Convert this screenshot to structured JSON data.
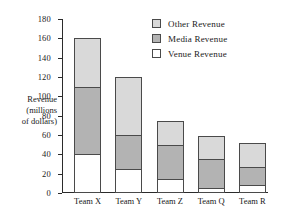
{
  "chart_data": {
    "type": "bar",
    "stacked": true,
    "title": "",
    "xlabel": "",
    "ylabel": "Revenue (millions of dollars)",
    "ylabel_lines": [
      "Revenue",
      "(millions",
      "of dollars)"
    ],
    "categories": [
      "Team X",
      "Team Y",
      "Team Z",
      "Team Q",
      "Team R"
    ],
    "series": [
      {
        "name": "Venue Revenue",
        "color": "#ffffff",
        "values": [
          40,
          25,
          15,
          5,
          8
        ]
      },
      {
        "name": "Media Revenue",
        "color": "#b3b3b3",
        "values": [
          70,
          35,
          35,
          30,
          19
        ]
      },
      {
        "name": "Other Revenue",
        "color": "#d9d9d9",
        "values": [
          50,
          60,
          25,
          24,
          25
        ]
      }
    ],
    "totals": [
      160,
      120,
      75,
      59,
      52
    ],
    "ylim": [
      0,
      180
    ],
    "ytick_step": 20,
    "yticks": [
      0,
      20,
      40,
      60,
      80,
      100,
      120,
      140,
      160,
      180
    ],
    "ytick_labels": [
      "0",
      "20",
      "40",
      "60",
      "80",
      "100",
      "120",
      "140",
      "160",
      "180"
    ],
    "grid": false,
    "legend_position": "top-right",
    "legend": [
      {
        "label": "Other Revenue",
        "color": "#d9d9d9"
      },
      {
        "label": "Media Revenue",
        "color": "#b3b3b3"
      },
      {
        "label": "Venue Revenue",
        "color": "#ffffff"
      }
    ],
    "axis_color": "#2b2b2b",
    "bar_border_color": "#4a4a4a",
    "background": "#ffffff"
  }
}
